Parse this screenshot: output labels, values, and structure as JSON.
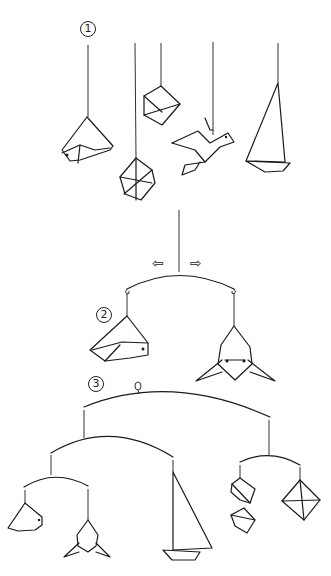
{
  "diagram": {
    "steps": [
      {
        "label": "1",
        "description": "Five origami models hung on strings: bird, diamond, cube, dove, sailboat"
      },
      {
        "label": "2",
        "description": "Balance two models on a curved wire; adjust hanging point left/right"
      },
      {
        "label": "3",
        "description": "Complete multi-tier mobile with hanging loop"
      }
    ],
    "arrows": {
      "left": "⇦",
      "right": "⇨"
    },
    "colors": {
      "ink": "#1a1a1a",
      "background": "#ffffff"
    }
  }
}
